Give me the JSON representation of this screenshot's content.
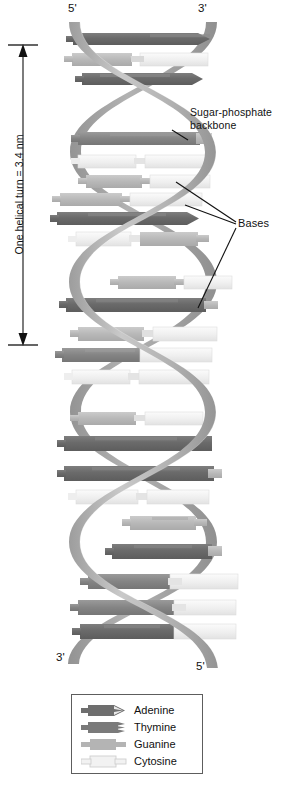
{
  "diagram": {
    "type": "molecular-structure-diagram"
  },
  "strand_ends": {
    "top_left": "5'",
    "top_right": "3'",
    "bottom_left": "3'",
    "bottom_right": "5'"
  },
  "measurement": {
    "label": "One helical turn = 3.4 nm",
    "value": "3.4",
    "unit": "nm",
    "axis_top_y": 45,
    "axis_bottom_y": 345
  },
  "annotations": {
    "backbone": "Sugar-phosphate\nbackbone",
    "backbone_line1": "Sugar-phosphate",
    "backbone_line2": "backbone",
    "bases": "Bases"
  },
  "legend": {
    "items": [
      {
        "label": "Adenine",
        "code": "A",
        "color": "#6e6e6e",
        "shape": "forked-dark"
      },
      {
        "label": "Thymine",
        "code": "T",
        "color": "#7a7a7a",
        "shape": "forked-dark-short"
      },
      {
        "label": "Guanine",
        "code": "G",
        "color": "#b4b4b4",
        "shape": "blocky-mid"
      },
      {
        "label": "Cytosine",
        "code": "C",
        "color": "#e8e8e8",
        "shape": "blocky-light"
      }
    ]
  },
  "colors": {
    "backbone_front": "#b9b9b9",
    "backbone_back": "#9a9a9a",
    "adenine": "#6e6e6e",
    "thymine": "#8c8c8c",
    "guanine": "#bdbdbd",
    "cytosine": "#efefef",
    "outline": "#8a8a8a",
    "text": "#111111",
    "background": "#ffffff"
  },
  "base_pairs": [
    {
      "index": 1,
      "y": 38,
      "left": "A",
      "right": "T"
    },
    {
      "index": 2,
      "y": 60,
      "left": "G",
      "right": "C"
    },
    {
      "index": 3,
      "y": 82,
      "left": "A",
      "right": "T"
    },
    {
      "index": 4,
      "y": 125,
      "left": "T",
      "right": "A"
    },
    {
      "index": 5,
      "y": 147,
      "left": "G",
      "right": "C"
    },
    {
      "index": 6,
      "y": 169,
      "left": "C",
      "right": "G"
    },
    {
      "index": 7,
      "y": 195,
      "left": "G",
      "right": "C"
    },
    {
      "index": 8,
      "y": 216,
      "left": "A",
      "right": "T"
    },
    {
      "index": 9,
      "y": 238,
      "left": "C",
      "right": "G"
    },
    {
      "index": 10,
      "y": 280,
      "left": "G",
      "right": "C"
    },
    {
      "index": 11,
      "y": 302,
      "left": "A",
      "right": "T"
    },
    {
      "index": 12,
      "y": 330,
      "left": "C",
      "right": "G"
    },
    {
      "index": 13,
      "y": 352,
      "left": "G",
      "right": "C"
    },
    {
      "index": 14,
      "y": 374,
      "left": "C",
      "right": "G"
    },
    {
      "index": 15,
      "y": 416,
      "left": "G",
      "right": "C"
    },
    {
      "index": 16,
      "y": 440,
      "left": "A",
      "right": "T"
    },
    {
      "index": 17,
      "y": 470,
      "left": "A",
      "right": "T"
    },
    {
      "index": 18,
      "y": 492,
      "left": "C",
      "right": "G"
    },
    {
      "index": 19,
      "y": 520,
      "left": "G",
      "right": "C"
    },
    {
      "index": 20,
      "y": 548,
      "left": "A",
      "right": "T"
    },
    {
      "index": 21,
      "y": 578,
      "left": "A",
      "right": "T"
    },
    {
      "index": 22,
      "y": 602,
      "left": "G",
      "right": "C"
    },
    {
      "index": 23,
      "y": 626,
      "left": "A",
      "right": "T"
    }
  ]
}
